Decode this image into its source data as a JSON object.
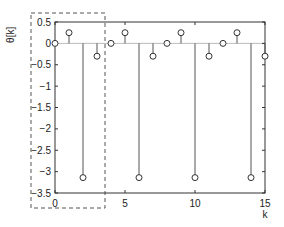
{
  "chart_data": {
    "type": "stem",
    "title": "",
    "xlabel": "k",
    "ylabel": "θ[k]",
    "xlim": [
      0,
      15
    ],
    "ylim": [
      -3.5,
      0.5
    ],
    "xticks": [
      "0",
      "5",
      "10",
      "15"
    ],
    "yticks": [
      "0.5",
      "0",
      "−0.5",
      "−1",
      "−1.5",
      "−2",
      "−2.5",
      "−3",
      "−3.5"
    ],
    "x": [
      0,
      1,
      2,
      3,
      4,
      5,
      6,
      7,
      8,
      9,
      10,
      11,
      12,
      13,
      14,
      15
    ],
    "values": [
      0,
      0.25,
      -3.14,
      -0.3,
      0,
      0.25,
      -3.14,
      -0.3,
      0,
      0.25,
      -3.14,
      -0.3,
      0,
      0.25,
      -3.14,
      -0.3
    ],
    "annotations": [
      {
        "type": "dashed-box",
        "x_range": [
          -1,
          3.5
        ],
        "y_range": [
          -4,
          0.75
        ]
      }
    ],
    "grid": false
  },
  "colors": {
    "axis": "#333333",
    "stem": "#555555",
    "zero_line": "#bbbbbb"
  }
}
